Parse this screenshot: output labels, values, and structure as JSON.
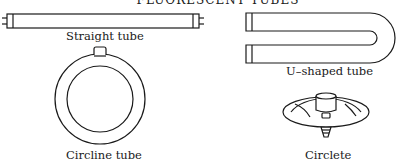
{
  "title": "FLUORESCENT TUBES",
  "figures": [
    {
      "id": "straight",
      "label": "Straight tube"
    },
    {
      "id": "u-shaped",
      "label": "U–shaped tube"
    },
    {
      "id": "circline",
      "label": "Circline tube"
    },
    {
      "id": "circlete",
      "label": "Circlete"
    }
  ],
  "colors": {
    "stroke": "#1a1a1a",
    "background": "#ffffff"
  }
}
